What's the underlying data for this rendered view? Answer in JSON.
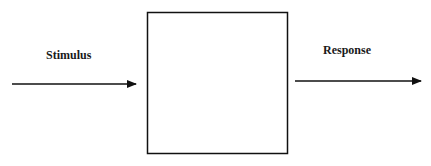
{
  "diagram": {
    "type": "block-diagram",
    "nodes": [
      {
        "id": "system-box",
        "label": ""
      }
    ],
    "edges": [
      {
        "id": "input-arrow",
        "label": "Stimulus",
        "to": "system-box"
      },
      {
        "id": "output-arrow",
        "label": "Response",
        "from": "system-box"
      }
    ],
    "labels": {
      "stimulus": "Stimulus",
      "response": "Response"
    },
    "colors": {
      "stroke": "#111111",
      "background": "#ffffff"
    }
  }
}
